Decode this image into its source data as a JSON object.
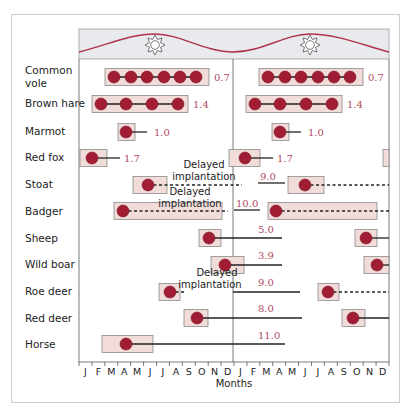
{
  "chart_data": {
    "type": "timeline",
    "title": "",
    "xlabel": "Months",
    "ylabel": "",
    "x_ticks": [
      "J",
      "F",
      "M",
      "A",
      "M",
      "J",
      "J",
      "A",
      "S",
      "O",
      "N",
      "D",
      "J",
      "F",
      "M",
      "A",
      "M",
      "J",
      "J",
      "A",
      "S",
      "O",
      "N",
      "D"
    ],
    "years_shown": 2,
    "banner": {
      "description": "day-length sine curve with sun icons at summer peaks",
      "sun_icons": 2
    },
    "colors": {
      "dot": "#a11d33",
      "box_fill": "#f1dcd9",
      "box_stroke": "#8a8a8a",
      "wave": "#b0324a",
      "banner_bg": "#e8eaed",
      "value_text": "#b04a5e"
    },
    "legend": [],
    "series": [
      {
        "name": "Common vole",
        "label_lines": [
          "Common",
          "vole"
        ],
        "value": "0.7",
        "mating_season": "Mar–Sep",
        "litters_per_season": 6
      },
      {
        "name": "Brown hare",
        "label_lines": [
          "Brown hare"
        ],
        "value": "1.4",
        "mating_season": "Jan–Aug",
        "litters_per_season": 4
      },
      {
        "name": "Marmot",
        "label_lines": [
          "Marmot"
        ],
        "value": "1.0",
        "mating_season": "Apr–May"
      },
      {
        "name": "Red fox",
        "label_lines": [
          "Red fox"
        ],
        "value": "1.7",
        "mating_season": "Jan–Feb"
      },
      {
        "name": "Stoat",
        "label_lines": [
          "Stoat"
        ],
        "value": "9.0",
        "mating_season": "Jun–Aug",
        "note": "Delayed implantation"
      },
      {
        "name": "Badger",
        "label_lines": [
          "Badger"
        ],
        "value": "10.0",
        "mating_season": "Mar–Dec",
        "note": "Delayed implantation"
      },
      {
        "name": "Sheep",
        "label_lines": [
          "Sheep"
        ],
        "value": "5.0",
        "mating_season": "Sep–Nov"
      },
      {
        "name": "Wild boar",
        "label_lines": [
          "Wild boar"
        ],
        "value": "3.9",
        "mating_season": "Nov–Dec"
      },
      {
        "name": "Roe deer",
        "label_lines": [
          "Roe deer"
        ],
        "value": "9.0",
        "mating_season": "Jul–Aug",
        "note": "Delayed implantation"
      },
      {
        "name": "Red deer",
        "label_lines": [
          "Red deer"
        ],
        "value": "8.0",
        "mating_season": "Sep–Oct"
      },
      {
        "name": "Horse",
        "label_lines": [
          "Horse"
        ],
        "value": "11.0",
        "mating_season": "Feb–Jun"
      }
    ],
    "value_meaning": "gestation length (months)"
  }
}
